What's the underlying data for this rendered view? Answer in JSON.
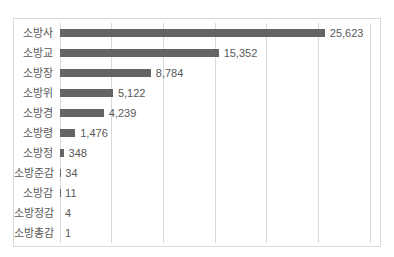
{
  "chart_data": {
    "type": "bar",
    "orientation": "horizontal",
    "title": "",
    "xlabel": "",
    "ylabel": "",
    "categories": [
      "소방사",
      "소방교",
      "소방장",
      "소방위",
      "소방경",
      "소방령",
      "소방정",
      "소방준감",
      "소방감",
      "소방정감",
      "소방총감"
    ],
    "values": [
      25623,
      15352,
      8784,
      5122,
      4239,
      1476,
      348,
      34,
      11,
      4,
      1
    ],
    "value_labels": [
      "25,623",
      "15,352",
      "8,784",
      "5,122",
      "4,239",
      "1,476",
      "348",
      "34",
      "11",
      "4",
      "1"
    ],
    "xlim": [
      0,
      30000
    ],
    "gridline_interval": 5000,
    "grid": true,
    "legend": false,
    "data_labels": true,
    "colors": {
      "bar": "#646464",
      "text": "#595959",
      "gridline": "#d9d9d9",
      "frame_border": "#d9d9d9",
      "background": "#ffffff"
    }
  }
}
